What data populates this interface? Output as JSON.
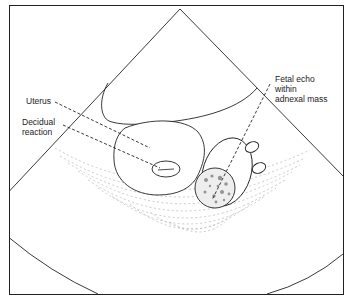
{
  "diagram": {
    "type": "ultrasound-schematic",
    "labels": {
      "uterus": "Uterus",
      "decidual_reaction": "Decidual\nreaction",
      "fetal_echo": "Fetal echo\nwithin\nadnexal mass"
    },
    "colors": {
      "line": "#222222",
      "speckle": "#b8b8b8",
      "fetal_texture": "#555555",
      "background": "#ffffff"
    }
  }
}
